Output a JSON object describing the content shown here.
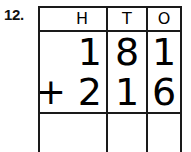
{
  "problem": {
    "number_label": "12.",
    "type": "column-addition",
    "operator": "+",
    "addends": [
      181,
      216
    ],
    "answer": ""
  },
  "grid": {
    "column_headers": [
      "H",
      "T",
      "O"
    ],
    "column_names": [
      "hundreds",
      "tens",
      "ones"
    ],
    "rows": [
      {
        "name": "addend-1",
        "operator": "",
        "digits": {
          "h": "1",
          "t": "8",
          "o": "1"
        }
      },
      {
        "name": "addend-2",
        "operator": "+",
        "digits": {
          "h": "2",
          "t": "1",
          "o": "6"
        }
      },
      {
        "name": "answer",
        "operator": "",
        "digits": {
          "h": "",
          "t": "",
          "o": ""
        }
      }
    ]
  },
  "colors": {
    "ink": "#000000",
    "rule": "#1a1a1a",
    "paper": "#ffffff"
  }
}
